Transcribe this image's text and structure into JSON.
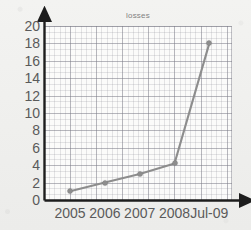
{
  "header": {
    "cropped_line": "",
    "title": "losses"
  },
  "chart_data": {
    "type": "line",
    "title": "losses",
    "xlabel": "",
    "ylabel": "",
    "categories": [
      "2005",
      "2006",
      "2007",
      "2008",
      "Jul-09"
    ],
    "values": [
      1,
      2,
      3,
      4.2,
      18
    ],
    "series": [
      {
        "name": "losses",
        "values": [
          1,
          2,
          3,
          4.2,
          18
        ]
      }
    ],
    "ylim": [
      0,
      20
    ],
    "ytick_step": 2,
    "yticks": [
      "20",
      "18",
      "16",
      "14",
      "12",
      "10",
      "8",
      "6",
      "4",
      "2",
      "0"
    ],
    "ytick_values": [
      20,
      18,
      16,
      14,
      12,
      10,
      8,
      6,
      4,
      2,
      0
    ],
    "grid": true,
    "minor_grid": true,
    "legend": false,
    "marker": "circle",
    "colors": {
      "line": "#8d8d8d",
      "marker": "#8d8d8d",
      "axis": "#1d1d1d",
      "grid_major": "#787884",
      "grid_minor": "#8c8c96",
      "tick_label": "#5a5a5a",
      "title": "#6d6d6d",
      "background": "#f1f1ef",
      "plot_background": "#fbfbfa"
    }
  }
}
